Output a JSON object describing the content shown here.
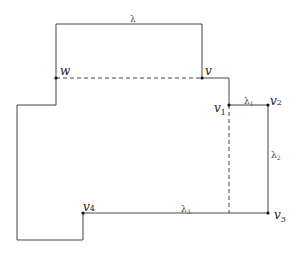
{
  "diagram": {
    "stroke_color": "#444444",
    "vertices": {
      "w": {
        "label": "w",
        "sub": "",
        "x": 56,
        "y": 78
      },
      "v": {
        "label": "v",
        "sub": "",
        "x": 202,
        "y": 78
      },
      "v1": {
        "label": "v",
        "sub": "1",
        "x": 229,
        "y": 105
      },
      "v2": {
        "label": "v",
        "sub": "2",
        "x": 268,
        "y": 105
      },
      "v3": {
        "label": "v",
        "sub": "3",
        "x": 268,
        "y": 213
      },
      "v4": {
        "label": "v",
        "sub": "4",
        "x": 83,
        "y": 213
      }
    },
    "edge_labels": {
      "lambda": {
        "label": "λ",
        "sub": ""
      },
      "lambda1": {
        "label": "λ",
        "sub": "1"
      },
      "lambda2": {
        "label": "λ",
        "sub": "2"
      },
      "lambda3": {
        "label": "λ",
        "sub": "3"
      }
    }
  }
}
